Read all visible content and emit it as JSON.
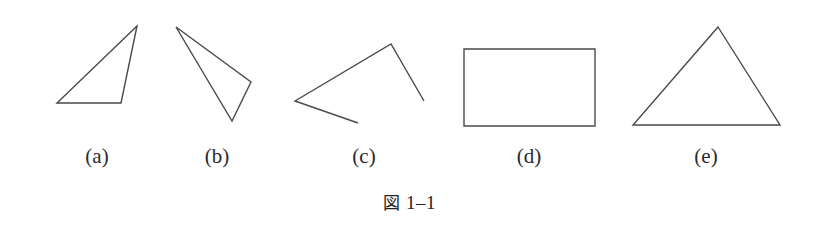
{
  "figure": {
    "background_color": "#ffffff",
    "stroke_color": "#4a4a4a",
    "stroke_width": 1.4,
    "caption_mark": "図",
    "caption_number": "1–1",
    "caption_full": "図 1–1"
  },
  "panels": [
    {
      "id": "a",
      "label": "(a)",
      "shape": "triangle",
      "closed": true,
      "label_x": 97,
      "label_y": 146,
      "points": [
        [
          137,
          26
        ],
        [
          57,
          103
        ],
        [
          121,
          103
        ]
      ]
    },
    {
      "id": "b",
      "label": "(b)",
      "shape": "triangle",
      "closed": true,
      "label_x": 217,
      "label_y": 146,
      "points": [
        [
          176,
          27
        ],
        [
          251,
          82
        ],
        [
          232,
          121
        ]
      ]
    },
    {
      "id": "c",
      "label": "(c)",
      "shape": "open-polyline",
      "closed": false,
      "label_x": 364,
      "label_y": 146,
      "points": [
        [
          424,
          101
        ],
        [
          391,
          44
        ],
        [
          295,
          101
        ],
        [
          358,
          123
        ]
      ]
    },
    {
      "id": "d",
      "label": "(d)",
      "shape": "rectangle",
      "closed": true,
      "label_x": 529,
      "label_y": 146,
      "points": [
        [
          464,
          49
        ],
        [
          595,
          49
        ],
        [
          595,
          126
        ],
        [
          464,
          126
        ]
      ]
    },
    {
      "id": "e",
      "label": "(e)",
      "shape": "triangle",
      "closed": true,
      "label_x": 706,
      "label_y": 146,
      "points": [
        [
          718,
          27
        ],
        [
          780,
          125
        ],
        [
          633,
          125
        ]
      ]
    }
  ]
}
